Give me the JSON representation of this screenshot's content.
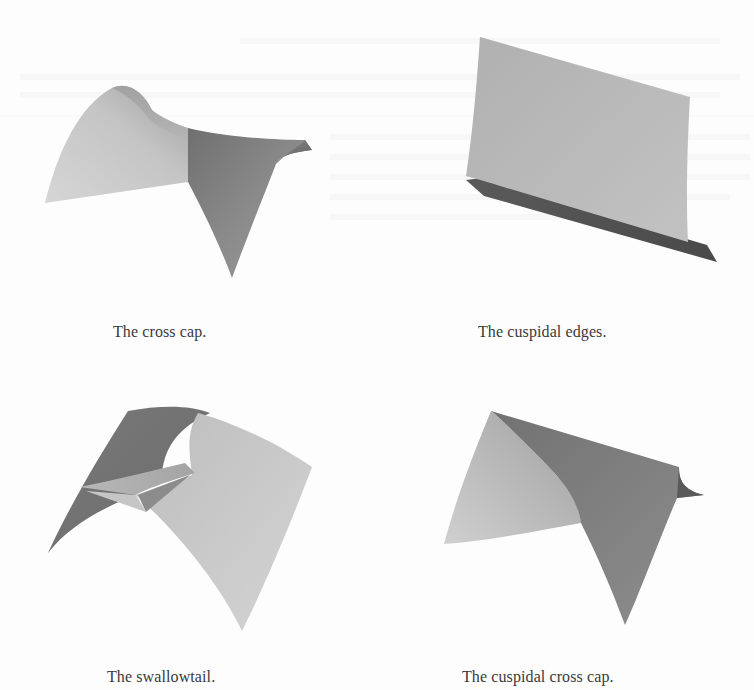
{
  "figures": [
    {
      "id": "cross-cap",
      "caption": "The cross cap.",
      "position": "top-left"
    },
    {
      "id": "cuspidal-edges",
      "caption": "The cuspidal edges.",
      "position": "top-right"
    },
    {
      "id": "swallowtail",
      "caption": "The swallowtail.",
      "position": "bottom-left"
    },
    {
      "id": "cuspidal-cross-cap",
      "caption": "The cuspidal cross cap.",
      "position": "bottom-right"
    }
  ],
  "colors": {
    "background": "#fdfdfd",
    "surface_light": "#cfcfcf",
    "surface_mid": "#a9a9a9",
    "surface_dark": "#6f6f6f",
    "caption_text": "#3a3a3a"
  }
}
